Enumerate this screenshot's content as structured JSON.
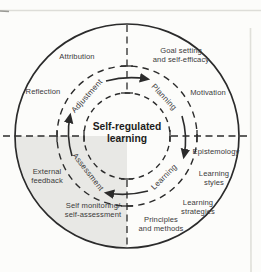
{
  "diagram": {
    "center_label": "Self-regulated\nlearning",
    "outer_labels": {
      "attribution": "Attribution",
      "goal_setting": "Goal setting\nand self-efficacy",
      "reflection": "Reflection",
      "motivation": "Motivation",
      "epistemology": "Epistemology",
      "learning_styles": "Learning\nstyles",
      "learning_strategies": "Learning\nstrategies",
      "principles_methods": "Principles\nand methods",
      "self_monitoring": "Self monitoring/\nself-assessment",
      "external_feedback": "External\nfeedback"
    },
    "cycle_labels": {
      "planning": "Planning",
      "learning": "Learning",
      "assessment": "Assessment",
      "adjustment": "Adjustment"
    },
    "colors": {
      "line": "#2b2b2b",
      "shaded_quadrant": "#e8e8e5",
      "background": "#fcfcfa",
      "label_text": "#3a3a3a"
    }
  }
}
